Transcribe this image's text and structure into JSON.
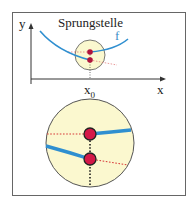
{
  "figure": {
    "title": "Sprungstelle",
    "y_axis_label": "y",
    "x_axis_label": "x",
    "function_label": "f",
    "point_label": "x",
    "point_label_subscript": "0",
    "colors": {
      "curve": "#2f8fd0",
      "circle_fill": "#fbf8cf",
      "dot": "#c8143c",
      "dotted_red": "#e05050",
      "frame": "#555555"
    }
  }
}
